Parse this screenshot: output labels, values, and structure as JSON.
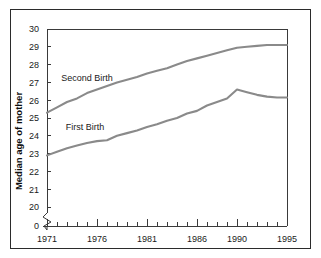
{
  "chart_data": {
    "type": "line",
    "title": "",
    "xlabel": "",
    "ylabel": "Median age of mother",
    "xlim": [
      1971,
      1995
    ],
    "ylim": [
      19.6,
      30
    ],
    "y_axis_break": true,
    "y_break_label": "0",
    "grid": false,
    "legend_position": "inline-annotation",
    "yticks": [
      30,
      29,
      28,
      27,
      26,
      25,
      24,
      23,
      22,
      21,
      20
    ],
    "ytick_labels": [
      "30",
      "29",
      "28",
      "27",
      "26",
      "25",
      "24",
      "23",
      "22",
      "21",
      "20"
    ],
    "xticks": [
      1971,
      1972,
      1973,
      1974,
      1975,
      1976,
      1977,
      1978,
      1979,
      1980,
      1981,
      1982,
      1983,
      1984,
      1985,
      1986,
      1987,
      1988,
      1989,
      1990,
      1991,
      1992,
      1993,
      1994,
      1995
    ],
    "xtick_labels_shown": [
      "1971",
      "1976",
      "1981",
      "1986",
      "1990",
      "1995"
    ],
    "xtick_label_years": [
      1971,
      1976,
      1981,
      1986,
      1990,
      1995
    ],
    "x": [
      1971,
      1972,
      1973,
      1974,
      1975,
      1976,
      1977,
      1978,
      1979,
      1980,
      1981,
      1982,
      1983,
      1984,
      1985,
      1986,
      1987,
      1988,
      1989,
      1990,
      1991,
      1992,
      1993,
      1994,
      1995
    ],
    "series": [
      {
        "name": "Second Birth",
        "color": "#8a8a8a",
        "values": [
          25.3,
          25.6,
          25.9,
          26.1,
          26.4,
          26.6,
          26.8,
          27.0,
          27.15,
          27.3,
          27.5,
          27.65,
          27.8,
          28.0,
          28.2,
          28.35,
          28.5,
          28.65,
          28.8,
          28.95,
          29.0,
          29.05,
          29.1,
          29.1,
          29.1
        ],
        "label_position": {
          "x": 1975.0,
          "y": 27.1
        }
      },
      {
        "name": "First Birth",
        "color": "#8a8a8a",
        "values": [
          22.9,
          23.1,
          23.3,
          23.45,
          23.6,
          23.7,
          23.75,
          24.0,
          24.15,
          24.3,
          24.5,
          24.65,
          24.85,
          25.0,
          25.25,
          25.4,
          25.7,
          25.9,
          26.1,
          26.6,
          26.45,
          26.3,
          26.2,
          26.15,
          26.15
        ],
        "label_position": {
          "x": 1974.8,
          "y": 24.3
        }
      }
    ]
  },
  "figure": {
    "border_color": "#2b2b2b",
    "background": "#ffffff"
  }
}
